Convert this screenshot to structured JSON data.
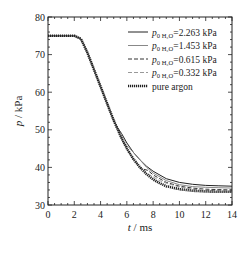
{
  "chart_data": {
    "type": "line",
    "title": "",
    "xlabel": "t / ms",
    "ylabel": "p / kPa",
    "xlim": [
      0,
      14
    ],
    "ylim": [
      30,
      80
    ],
    "xticks": [
      0,
      2,
      4,
      6,
      8,
      10,
      12,
      14
    ],
    "yticks": [
      30,
      40,
      50,
      60,
      70,
      80
    ],
    "grid": false,
    "legend_position": "upper right",
    "series": [
      {
        "name": "p0 H2O=2.263 kPa",
        "style": "solid-dark",
        "x": [
          0,
          2.0,
          2.5,
          3,
          3.5,
          4,
          4.5,
          5.0,
          5.3,
          5.6,
          6,
          6.5,
          7,
          7.5,
          8,
          9,
          10,
          11,
          12,
          13,
          14
        ],
        "y": [
          75,
          75,
          74.2,
          70.5,
          66,
          61.5,
          57,
          52.5,
          50.5,
          49,
          46.5,
          44,
          42,
          40.3,
          39,
          37,
          36,
          35.5,
          35.2,
          35.1,
          35
        ]
      },
      {
        "name": "p0 H2O=1.453 kPa",
        "style": "solid-light",
        "x": [
          0,
          2.0,
          2.5,
          3,
          3.5,
          4,
          4.5,
          5,
          5.5,
          5.8,
          6.1,
          6.5,
          7,
          7.5,
          8,
          9,
          10,
          11,
          12,
          13,
          14
        ],
        "y": [
          75,
          75,
          74.2,
          70.5,
          66,
          61.5,
          57,
          52.5,
          48.5,
          46,
          45.5,
          44,
          42,
          40,
          38.5,
          36.5,
          35.4,
          34.9,
          34.7,
          34.6,
          34.5
        ]
      },
      {
        "name": "p0 H2O=0.615 kPa",
        "style": "dashed-dark",
        "x": [
          0,
          2.0,
          2.5,
          3,
          3.5,
          4,
          4.5,
          5,
          5.5,
          6,
          6.5,
          7,
          7.3,
          7.6,
          8,
          9,
          10,
          11,
          12,
          13,
          14
        ],
        "y": [
          75,
          75,
          74.2,
          70.5,
          66,
          61.5,
          57,
          52.5,
          48.5,
          45,
          42.2,
          40,
          39.5,
          39.2,
          38,
          36,
          35,
          34.5,
          34.2,
          34.1,
          34
        ]
      },
      {
        "name": "p0 H2O=0.332 kPa",
        "style": "dashed-light",
        "x": [
          0,
          2.0,
          2.5,
          3,
          3.5,
          4,
          4.5,
          5,
          5.5,
          6,
          6.5,
          7,
          7.5,
          8,
          8.5,
          9,
          10,
          11,
          12,
          13,
          14
        ],
        "y": [
          75,
          75,
          74.2,
          70.5,
          66,
          61.5,
          57,
          52.5,
          48.5,
          45,
          42.2,
          40,
          38.5,
          37.5,
          36.5,
          35.8,
          34.8,
          34.2,
          33.9,
          33.8,
          33.7
        ]
      },
      {
        "name": "pure argon",
        "style": "dotted-thick",
        "x": [
          0,
          2.0,
          2.5,
          3,
          3.5,
          4,
          4.5,
          5,
          5.5,
          6,
          6.5,
          7,
          7.5,
          8,
          8.5,
          9,
          10,
          11,
          12,
          13,
          14
        ],
        "y": [
          75,
          75,
          74.2,
          70.5,
          66,
          61.5,
          57,
          52.5,
          48.5,
          45,
          42.2,
          40,
          38.2,
          36.8,
          35.8,
          35,
          34.2,
          33.8,
          33.6,
          33.5,
          33.5
        ]
      }
    ]
  },
  "legend": {
    "items": [
      {
        "prefix": "p",
        "sub": "0 H₂O",
        "value": "=2.263 kPa"
      },
      {
        "prefix": "p",
        "sub": "0 H₂O",
        "value": "=1.453 kPa"
      },
      {
        "prefix": "p",
        "sub": "0 H₂O",
        "value": "=0.615 kPa"
      },
      {
        "prefix": "p",
        "sub": "0 H₂O",
        "value": "=0.332 kPa"
      },
      {
        "label": "pure argon"
      }
    ]
  },
  "axes": {
    "x_label_italic": "t",
    "x_label_rest": " / ms",
    "y_label_italic": "p",
    "y_label_rest": " / kPa"
  }
}
